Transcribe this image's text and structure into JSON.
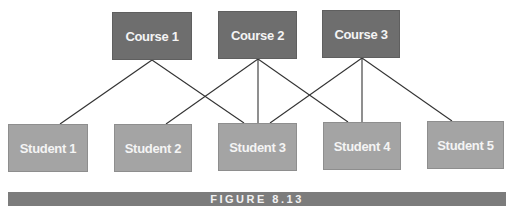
{
  "diagram": {
    "type": "bipartite-relationship",
    "courses": [
      {
        "id": "c1",
        "label": "Course 1",
        "x": 112,
        "y": 12,
        "w": 80,
        "h": 48
      },
      {
        "id": "c2",
        "label": "Course 2",
        "x": 218,
        "y": 11,
        "w": 79,
        "h": 48
      },
      {
        "id": "c3",
        "label": "Course 3",
        "x": 322,
        "y": 10,
        "w": 78,
        "h": 48
      }
    ],
    "students": [
      {
        "id": "s1",
        "label": "Student 1",
        "x": 8,
        "y": 124,
        "w": 80,
        "h": 48
      },
      {
        "id": "s2",
        "label": "Student 2",
        "x": 114,
        "y": 124,
        "w": 78,
        "h": 48
      },
      {
        "id": "s3",
        "label": "Student 3",
        "x": 218,
        "y": 123,
        "w": 79,
        "h": 48
      },
      {
        "id": "s4",
        "label": "Student 4",
        "x": 323,
        "y": 122,
        "w": 78,
        "h": 48
      },
      {
        "id": "s5",
        "label": "Student 5",
        "x": 427,
        "y": 121,
        "w": 77,
        "h": 48
      }
    ],
    "edges": [
      {
        "from": "Course 1",
        "to": "Student 1",
        "x1": 152,
        "y1": 60,
        "x2": 60,
        "y2": 124
      },
      {
        "from": "Course 1",
        "to": "Student 3",
        "x1": 152,
        "y1": 60,
        "x2": 244,
        "y2": 123
      },
      {
        "from": "Course 2",
        "to": "Student 2",
        "x1": 258,
        "y1": 59,
        "x2": 166,
        "y2": 124
      },
      {
        "from": "Course 2",
        "to": "Student 3",
        "x1": 258,
        "y1": 59,
        "x2": 258,
        "y2": 123
      },
      {
        "from": "Course 2",
        "to": "Student 4",
        "x1": 258,
        "y1": 59,
        "x2": 348,
        "y2": 122
      },
      {
        "from": "Course 3",
        "to": "Student 3",
        "x1": 362,
        "y1": 58,
        "x2": 270,
        "y2": 123
      },
      {
        "from": "Course 3",
        "to": "Student 4",
        "x1": 362,
        "y1": 58,
        "x2": 362,
        "y2": 122
      },
      {
        "from": "Course 3",
        "to": "Student 5",
        "x1": 362,
        "y1": 58,
        "x2": 452,
        "y2": 121
      }
    ]
  },
  "figure": {
    "label": "FIGURE 8.13"
  },
  "colors": {
    "course_fill": "#6e6e6e",
    "student_fill": "#a4a4a4",
    "edge": "#333333",
    "figure_bar": "#7c7c7c"
  }
}
